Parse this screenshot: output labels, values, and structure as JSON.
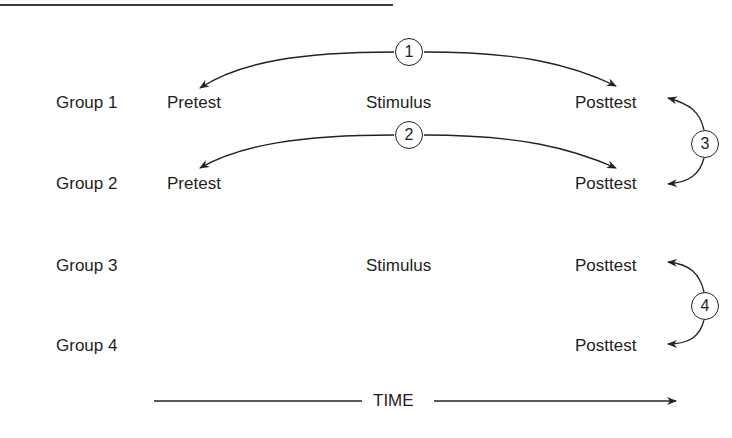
{
  "diagram": {
    "title_rule": true,
    "groups": [
      {
        "label": "Group 1",
        "pretest": "Pretest",
        "stimulus": "Stimulus",
        "posttest": "Posttest"
      },
      {
        "label": "Group 2",
        "pretest": "Pretest",
        "stimulus": "",
        "posttest": "Posttest"
      },
      {
        "label": "Group 3",
        "pretest": "",
        "stimulus": "Stimulus",
        "posttest": "Posttest"
      },
      {
        "label": "Group 4",
        "pretest": "",
        "stimulus": "",
        "posttest": "Posttest"
      }
    ],
    "comparisons": [
      {
        "number": "1",
        "from": "Group 1 Pretest",
        "to": "Group 1 Posttest"
      },
      {
        "number": "2",
        "from": "Group 2 Pretest",
        "to": "Group 2 Posttest"
      },
      {
        "number": "3",
        "from": "Group 1 Posttest",
        "to": "Group 2 Posttest"
      },
      {
        "number": "4",
        "from": "Group 3 Posttest",
        "to": "Group 4 Posttest"
      }
    ],
    "time_axis_label": "TIME",
    "colors": {
      "ink": "#1e1e1e",
      "background": "#ffffff"
    }
  }
}
